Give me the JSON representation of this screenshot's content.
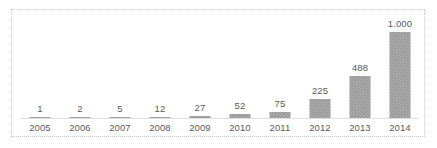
{
  "chart_data": {
    "type": "bar",
    "title": "",
    "subtitle": "",
    "xlabel": "",
    "ylabel": "",
    "categories": [
      "2005",
      "2006",
      "2007",
      "2008",
      "2009",
      "2010",
      "2011",
      "2012",
      "2013",
      "2014"
    ],
    "values": [
      1,
      2,
      5,
      12,
      27,
      52,
      75,
      225,
      488,
      1000
    ],
    "value_labels": [
      "1",
      "2",
      "5",
      "12",
      "27",
      "52",
      "75",
      "225",
      "488",
      "1.000"
    ],
    "ylim": [
      0,
      1000
    ],
    "grid": false,
    "legend": null,
    "legend_position": "none",
    "axis_line": true,
    "y_axis_visible": false,
    "data_labels_shown": true,
    "colors": {
      "bar_fill": "#949494",
      "label_text": "#5a5a5a",
      "axis_line": "#dedede",
      "frame_border": "#c9c9c9",
      "background": "#ffffff"
    }
  }
}
